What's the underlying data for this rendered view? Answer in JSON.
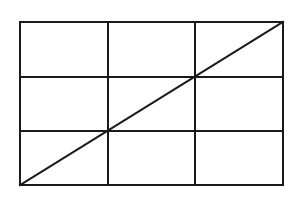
{
  "figure": {
    "name": "grid-rectangle-with-diagonal",
    "background_color": "#ffffff",
    "line_color": "#1a1a1a",
    "border_width": 2,
    "grid_line_width": 2,
    "diagonal_width": 2,
    "labels": [],
    "rectangle": {
      "x": 20,
      "y": 22,
      "width": 263,
      "height": 163,
      "right": 283,
      "bottom": 185
    },
    "grid": {
      "columns": 3,
      "rows": 3,
      "vertical_lines_x": [
        108,
        195
      ],
      "horizontal_lines_y": [
        77,
        131
      ],
      "column_width": 87.7,
      "row_height": 54.3
    },
    "diagonal": {
      "x1": 20,
      "y1": 185,
      "x2": 283,
      "y2": 22,
      "passes_through": [
        {
          "x": 108,
          "y": 131
        },
        {
          "x": 195,
          "y": 77
        }
      ]
    }
  }
}
